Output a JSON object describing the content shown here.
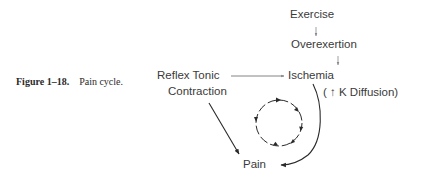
{
  "caption": {
    "number": "Figure 1–18.",
    "title": "Pain cycle."
  },
  "nodes": {
    "exercise": "Exercise",
    "overexertion": "Overexertion",
    "reflex_line1": "Reflex Tonic",
    "reflex_line2": "Contraction",
    "ischemia": "Ischemia",
    "k_diffusion": "( ↑ K Diffusion)",
    "pain": "Pain"
  },
  "edges": [
    {
      "from": "Exercise",
      "to": "Overexertion"
    },
    {
      "from": "Overexertion",
      "to": "Ischemia"
    },
    {
      "from": "Reflex Tonic Contraction",
      "to": "Ischemia"
    },
    {
      "from": "Reflex Tonic Contraction",
      "to": "Pain"
    },
    {
      "from": "Ischemia",
      "to": "Pain"
    }
  ],
  "cycle_symbol": "clockwise-cycle"
}
